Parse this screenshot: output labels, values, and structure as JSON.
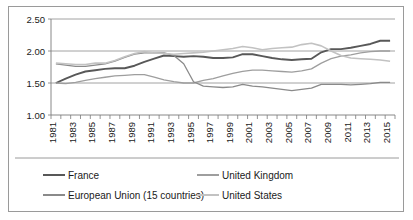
{
  "chart_data": {
    "type": "line",
    "title": "",
    "xlabel": "",
    "ylabel": "",
    "xlim": [
      1981,
      2016
    ],
    "ylim": [
      1.0,
      2.5
    ],
    "yticks": [
      "1.00",
      "1.50",
      "2.00",
      "2.50"
    ],
    "ytick_values": [
      1.0,
      1.5,
      2.0,
      2.5
    ],
    "grid": true,
    "legend_position": "bottom",
    "x": [
      1981,
      1982,
      1983,
      1984,
      1985,
      1986,
      1987,
      1988,
      1989,
      1990,
      1991,
      1992,
      1993,
      1994,
      1995,
      1996,
      1997,
      1998,
      1999,
      2000,
      2001,
      2002,
      2003,
      2004,
      2005,
      2006,
      2007,
      2008,
      2009,
      2010,
      2011,
      2012,
      2013,
      2014,
      2015
    ],
    "xtick_labels": [
      "1981",
      "1983",
      "1985",
      "1987",
      "1989",
      "1991",
      "1993",
      "1995",
      "1997",
      "1999",
      "2001",
      "2003",
      "2005",
      "2007",
      "2009",
      "2011",
      "2013",
      "2015"
    ],
    "series": [
      {
        "name": "France",
        "color": "#585858",
        "width": 1.9,
        "values": [
          1.5,
          1.57,
          1.63,
          1.68,
          1.7,
          1.72,
          1.73,
          1.73,
          1.77,
          1.83,
          1.88,
          1.93,
          1.92,
          1.91,
          1.92,
          1.91,
          1.89,
          1.89,
          1.9,
          1.95,
          1.95,
          1.92,
          1.89,
          1.87,
          1.86,
          1.87,
          1.88,
          1.98,
          2.03,
          2.03,
          2.05,
          2.08,
          2.11,
          2.16,
          2.16
        ]
      },
      {
        "name": "United Kingdom",
        "color": "#9e9e9e",
        "width": 1.3,
        "values": [
          1.5,
          1.49,
          1.51,
          1.54,
          1.57,
          1.59,
          1.61,
          1.62,
          1.63,
          1.63,
          1.59,
          1.55,
          1.52,
          1.5,
          1.5,
          1.54,
          1.57,
          1.61,
          1.65,
          1.68,
          1.7,
          1.7,
          1.69,
          1.68,
          1.67,
          1.69,
          1.72,
          1.81,
          1.88,
          1.92,
          1.94,
          1.97,
          1.99,
          2.0,
          2.0
        ]
      },
      {
        "name": "European Union (15 countries)",
        "color": "#8a8a8a",
        "width": 1.3,
        "values": [
          1.8,
          1.78,
          1.76,
          1.76,
          1.78,
          1.8,
          1.84,
          1.9,
          1.95,
          1.97,
          1.97,
          1.97,
          1.93,
          1.8,
          1.52,
          1.45,
          1.44,
          1.43,
          1.44,
          1.48,
          1.45,
          1.44,
          1.42,
          1.4,
          1.38,
          1.4,
          1.42,
          1.48,
          1.48,
          1.48,
          1.47,
          1.48,
          1.49,
          1.51,
          1.51
        ]
      },
      {
        "name": "United States",
        "color": "#c2c2c2",
        "width": 1.6,
        "values": [
          1.81,
          1.8,
          1.79,
          1.79,
          1.81,
          1.81,
          1.85,
          1.91,
          1.96,
          1.99,
          1.97,
          1.96,
          1.95,
          1.96,
          1.97,
          1.98,
          2.0,
          2.02,
          2.04,
          2.07,
          2.05,
          2.02,
          2.04,
          2.05,
          2.06,
          2.1,
          2.12,
          2.08,
          2.0,
          1.93,
          1.89,
          1.88,
          1.87,
          1.86,
          1.84
        ]
      }
    ]
  },
  "legend": {
    "entries": [
      {
        "label": "France",
        "color": "#585858"
      },
      {
        "label": "United Kingdom",
        "color": "#9e9e9e"
      },
      {
        "label": "European Union (15 countries)",
        "color": "#8a8a8a"
      },
      {
        "label": "United States",
        "color": "#c2c2c2"
      }
    ]
  }
}
